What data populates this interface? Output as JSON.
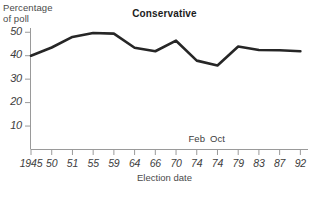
{
  "chart_data": {
    "type": "line",
    "title": "Conservative",
    "ylabel_line1": "Percentage",
    "ylabel_line2": "of poll",
    "xlabel": "Election date",
    "categories": [
      "1945",
      "50",
      "51",
      "55",
      "59",
      "64",
      "66",
      "70",
      "74",
      "74",
      "79",
      "83",
      "87",
      "92"
    ],
    "x_annotations": [
      {
        "label": "Feb",
        "category_index": 8
      },
      {
        "label": "Oct",
        "category_index": 9
      }
    ],
    "values": [
      40.0,
      43.5,
      48.0,
      49.7,
      49.4,
      43.4,
      41.9,
      46.4,
      37.9,
      35.8,
      43.9,
      42.4,
      42.3,
      41.9
    ],
    "yticks": [
      10,
      20,
      30,
      40,
      50
    ],
    "ylim": [
      0,
      53
    ],
    "grid": false,
    "legend": "none",
    "line_color": "#262626",
    "axis_color": "#9a9a9a"
  }
}
